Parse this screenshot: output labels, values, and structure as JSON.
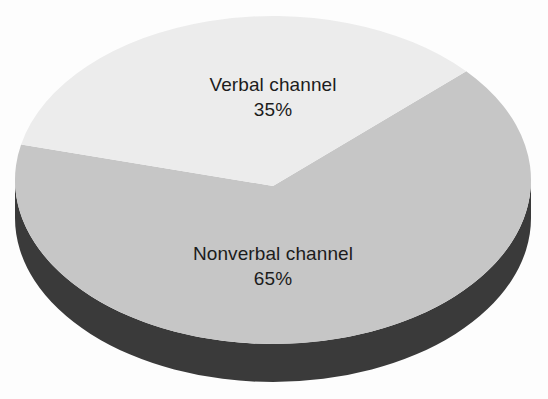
{
  "chart_data": {
    "type": "pie",
    "title": "",
    "subtitle": "",
    "xlabel": "",
    "ylabel": "",
    "three_d": true,
    "legend_position": "none",
    "grid": false,
    "labels_inside_slices": true,
    "categories": [
      "Verbal channel",
      "Nonverbal channel"
    ],
    "values": [
      35,
      65
    ],
    "value_unit": "%",
    "slices": [
      {
        "name": "Verbal channel",
        "value": 35,
        "value_label": "35%",
        "color": "#ececec",
        "side_color": "#ececec",
        "start_angle_deg": 192.5,
        "end_angle_deg": 318.5
      },
      {
        "name": "Nonverbal channel",
        "value": 65,
        "value_label": "65%",
        "color": "#c6c6c6",
        "side_color": "#3a3a3a",
        "start_angle_deg": 318.5,
        "end_angle_deg": 552.5
      }
    ]
  },
  "chart": {
    "background_color": "#fdfdfd",
    "text_color": "#1c1c1c",
    "geometry": {
      "center_x": 273,
      "center_y": 180,
      "radius_x": 258,
      "radius_y": 164,
      "depth": 38
    },
    "labels": {
      "verbal": {
        "name": "Verbal channel",
        "value": "35%"
      },
      "nonverbal": {
        "name": "Nonverbal channel",
        "value": "65%"
      }
    }
  }
}
